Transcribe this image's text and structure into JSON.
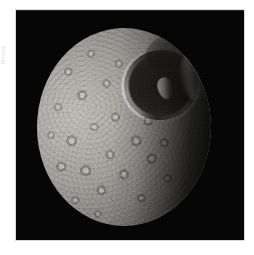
{
  "page": {
    "background_color": "#ffffff",
    "edge_caption_text": "Mimas"
  },
  "photo": {
    "name": "mimas-photograph",
    "field_color": "#050505",
    "frame": {
      "left": 16,
      "top": 10,
      "width": 228,
      "height": 230
    },
    "subject": "Mimas",
    "features": {
      "large_crater": "Herschel",
      "central_peak": "Herschel central peak",
      "secondary_basin": "degraded basin",
      "terminator": "terminator"
    },
    "disk": {
      "left": 37,
      "top": 28,
      "width": 174,
      "height": 198,
      "highlight_color": "#c2c0bb",
      "midtone_color": "#8e8c88",
      "shadow_color": "#141210"
    }
  }
}
